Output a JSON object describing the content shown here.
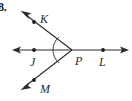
{
  "figure": {
    "problem_number": "8.",
    "type": "geometry-angle-diagram",
    "stroke_color": "#2b2b2b",
    "background_color": "#ffffff",
    "vertex": {
      "name": "P",
      "x": 72,
      "y": 50
    },
    "points": [
      {
        "label": "K",
        "x": 34,
        "y": 22,
        "dot": true
      },
      {
        "label": "J",
        "x": 34,
        "y": 50,
        "dot": true
      },
      {
        "label": "P",
        "x": 72,
        "y": 50,
        "dot": false
      },
      {
        "label": "L",
        "x": 103,
        "y": 50,
        "dot": true
      },
      {
        "label": "M",
        "x": 34,
        "y": 80,
        "dot": true
      }
    ],
    "labels": {
      "K": "K",
      "J": "J",
      "P": "P",
      "L": "L",
      "M": "M"
    },
    "rays": [
      {
        "name": "ray-PK",
        "from": [
          72,
          50
        ],
        "to": [
          21,
          11
        ],
        "arrow_at_end": true
      },
      {
        "name": "ray-PM",
        "from": [
          72,
          50
        ],
        "to": [
          21,
          90
        ],
        "arrow_at_end": true
      },
      {
        "name": "line-JL",
        "from": [
          13,
          50
        ],
        "to": [
          128,
          50
        ],
        "arrow_at_start": true,
        "arrow_at_end": true
      }
    ],
    "angle_arc": {
      "at": "P",
      "between": [
        "ray-PK",
        "ray-PM"
      ],
      "radius": 17
    }
  }
}
